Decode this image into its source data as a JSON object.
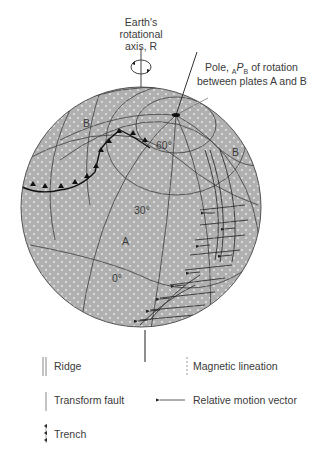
{
  "diagram": {
    "type": "plate-tectonics-globe",
    "labels": {
      "axis_line1": "Earth's",
      "axis_line2": "rotational",
      "axis_line3": "axis, R",
      "pole_line1_pre": "Pole, ",
      "pole_sub_A": "A",
      "pole_P": "P",
      "pole_sub_B": "B",
      "pole_line1_post": " of rotation",
      "pole_line2": "between plates A and B",
      "plate_B_left": "B",
      "plate_B_right": "B",
      "plate_A": "A",
      "lat_60": "60°",
      "lat_30": "30°",
      "lat_0": "0°"
    },
    "colors": {
      "globe_fill": "#b4b4b4",
      "line": "#3c3c3c",
      "background": "#ffffff"
    }
  },
  "legend": {
    "ridge": "Ridge",
    "transform_fault": "Transform fault",
    "trench": "Trench",
    "magnetic_lineation": "Magnetic lineation",
    "relative_motion_vector": "Relative motion vector"
  }
}
